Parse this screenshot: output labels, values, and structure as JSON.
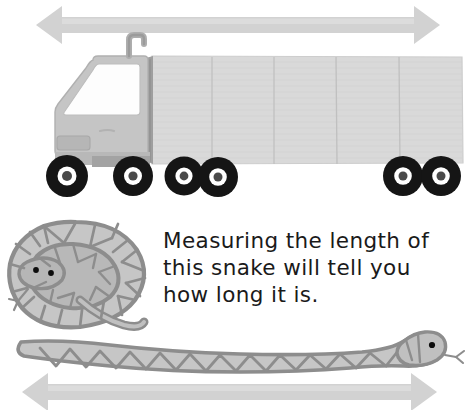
{
  "page": {
    "width": 469,
    "height": 410,
    "background": "#ffffff",
    "kind": "educational-illustration"
  },
  "caption": {
    "text": "Measuring the length of\nthis snake will tell you\nhow long it is.",
    "lines": [
      "Measuring the length of",
      "this snake will tell you",
      "how long it is."
    ],
    "color": "#1a1a1a"
  },
  "colors": {
    "arrow": "#d0d0d0",
    "arrow_edge": "#c4c4c4",
    "trailer_body": "#d9d9d9",
    "trailer_line": "#c2c2c2",
    "trailer_outline": "#cfcfcf",
    "cab_body": "#c3c3c3",
    "cab_outline": "#aeaeae",
    "cab_window": "#fdfdfd",
    "cab_dark": "#9a9a9a",
    "tire": "#151515",
    "rim": "#ffffff",
    "hub": "#4a4a4a",
    "snake_outline": "#8d8d8d",
    "snake_fill": "#c6c6c6",
    "snake_fill_dark": "#b2b2b2",
    "snake_eye": "#0d0d0d",
    "white": "#ffffff"
  },
  "elements": {
    "top_arrow": {
      "name": "truck-length-arrow",
      "direction": "double-headed-horizontal",
      "x1": 36,
      "x2": 440,
      "y": 25
    },
    "bottom_arrow": {
      "name": "snake-length-arrow",
      "direction": "double-headed-horizontal",
      "x1": 22,
      "x2": 437,
      "y": 392
    },
    "truck": {
      "name": "semi-truck",
      "panel_count": 5,
      "wheel_count": 6,
      "has_exhaust_stack": true,
      "facing": "left"
    },
    "coiled_snake": {
      "name": "coiled-snake",
      "eye_count": 2,
      "has_tongue": true,
      "pattern": "triangular-scales"
    },
    "stretched_snake": {
      "name": "stretched-snake",
      "eye_count": 1,
      "has_tongue": true,
      "pattern": "zigzag-triangles",
      "head_side": "right"
    }
  }
}
